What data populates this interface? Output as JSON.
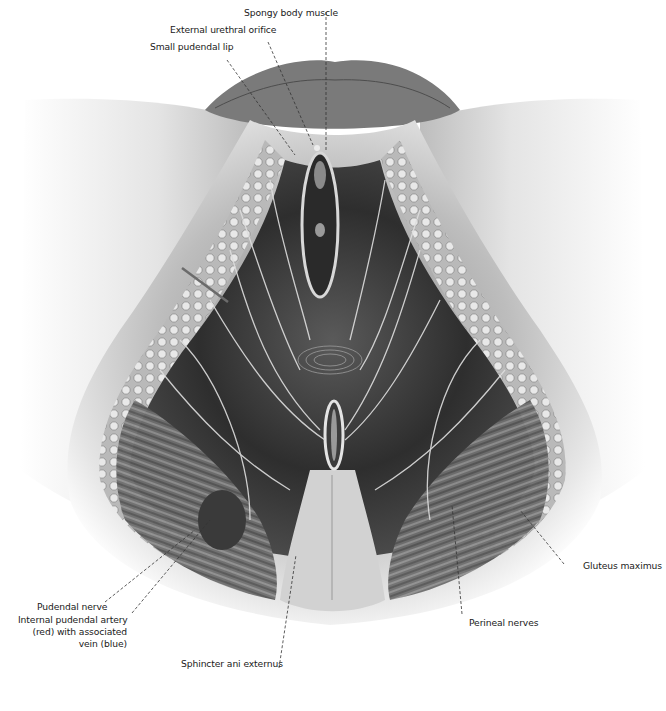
{
  "figure": {
    "background_color": "#ffffff",
    "illustration_tone": "grayscale"
  },
  "labels": {
    "spongy_body_muscle": "Spongy body muscle",
    "external_urethral_orifice": "External urethral orifice",
    "small_pudendal_lip": "Small pudendal lip",
    "pudendal_nerve": "Pudendal nerve",
    "internal_pudendal_artery_line1": "Internal pudendal artery",
    "internal_pudendal_artery_line2": "(red) with associated",
    "internal_pudendal_artery_line3": "vein (blue)",
    "sphincter_ani_externus": "Sphincter ani externus",
    "perineal_nerves": "Perineal nerves",
    "gluteus_maximus": "Gluteus maximus"
  }
}
